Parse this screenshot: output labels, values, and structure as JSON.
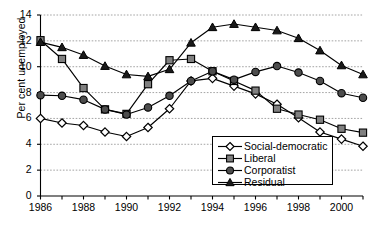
{
  "chart_data": {
    "type": "line",
    "title": "",
    "xlabel": "",
    "ylabel": "Per cent unemployed",
    "x": [
      1986,
      1987,
      1988,
      1989,
      1990,
      1991,
      1992,
      1993,
      1994,
      1995,
      1996,
      1997,
      1998,
      1999,
      2000,
      2001
    ],
    "xlim": [
      1986,
      2001
    ],
    "ylim": [
      0,
      14
    ],
    "ytick_labels": [
      "0",
      "2",
      "4",
      "6",
      "8",
      "10",
      "12",
      "14"
    ],
    "ytick_values": [
      0,
      2,
      4,
      6,
      8,
      10,
      12,
      14
    ],
    "xtick_labels": [
      "1986",
      "1988",
      "1990",
      "1992",
      "1994",
      "1996",
      "1998",
      "2000"
    ],
    "xtick_values": [
      1986,
      1988,
      1990,
      1992,
      1994,
      1996,
      1998,
      2000
    ],
    "grid": "horizontal-dotted",
    "legend_position": "lower-right-inside",
    "series": [
      {
        "name": "Social-democratic",
        "marker": "open-diamond",
        "color": "#000000",
        "fill": "#ffffff",
        "values": [
          6.0,
          5.65,
          5.45,
          4.95,
          4.6,
          5.3,
          6.75,
          8.9,
          9.1,
          8.5,
          7.9,
          7.1,
          6.05,
          4.95,
          4.4,
          3.85
        ]
      },
      {
        "name": "Liberal",
        "marker": "filled-square",
        "color": "#000000",
        "fill": "#808080",
        "values": [
          12.05,
          10.6,
          8.35,
          6.7,
          6.35,
          8.65,
          10.5,
          10.6,
          9.65,
          8.9,
          8.15,
          6.75,
          6.3,
          5.9,
          5.2,
          4.9
        ]
      },
      {
        "name": "Corporatist",
        "marker": "filled-circle",
        "color": "#000000",
        "fill": "#4d4d4d",
        "values": [
          7.8,
          7.75,
          7.45,
          6.7,
          6.3,
          6.85,
          7.75,
          8.9,
          9.65,
          9.0,
          9.6,
          10.05,
          9.55,
          8.9,
          7.95,
          7.6
        ]
      },
      {
        "name": "Residual",
        "marker": "filled-triangle",
        "color": "#000000",
        "fill": "#1a1a1a",
        "values": [
          11.9,
          11.5,
          10.9,
          10.05,
          9.4,
          9.25,
          9.8,
          11.85,
          13.05,
          13.3,
          13.05,
          12.8,
          12.2,
          11.25,
          10.1,
          9.4
        ]
      }
    ]
  }
}
